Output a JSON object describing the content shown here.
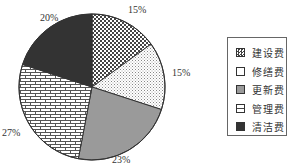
{
  "chart_data": {
    "type": "pie",
    "title": "",
    "categories": [
      "建设费",
      "修缮费",
      "更新费",
      "管理费",
      "清洁费"
    ],
    "values": [
      15,
      15,
      23,
      27,
      20
    ],
    "value_labels": [
      "15%",
      "15%",
      "23%",
      "27%",
      "20%"
    ],
    "start_angle": "12 o'clock",
    "direction": "clockwise",
    "legend_position": "right",
    "fills": [
      {
        "pattern": "crosshatch-checker",
        "color": "#555555"
      },
      {
        "pattern": "dots",
        "color": "#888888"
      },
      {
        "pattern": "solid",
        "color": "#9a9a9a"
      },
      {
        "pattern": "brick",
        "color": "#555555"
      },
      {
        "pattern": "solid",
        "color": "#333333"
      }
    ]
  },
  "legend": {
    "items": [
      {
        "label": "建设费"
      },
      {
        "label": "修缮费"
      },
      {
        "label": "更新费"
      },
      {
        "label": "管理费"
      },
      {
        "label": "清洁费"
      }
    ]
  }
}
